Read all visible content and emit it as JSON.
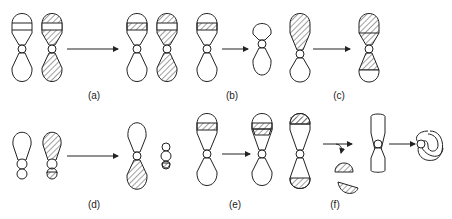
{
  "figure": {
    "panels": [
      {
        "id": "a",
        "label": "(a)",
        "description": "Reciprocal translocation between two chromosomes"
      },
      {
        "id": "b",
        "label": "(b)",
        "description": "Deletion of a segment"
      },
      {
        "id": "c",
        "label": "(c)",
        "description": "Duplication / transposition of segment"
      },
      {
        "id": "d",
        "label": "(d)",
        "description": "Robertsonian translocation (centric fusion)"
      },
      {
        "id": "e",
        "label": "(e)",
        "description": "Duplication"
      },
      {
        "id": "f",
        "label": "(f)",
        "description": "Ring chromosome formation with loss of terminal fragments"
      }
    ],
    "colors": {
      "stroke": "#222222",
      "background": "#ffffff",
      "hatch": "#444444"
    }
  }
}
